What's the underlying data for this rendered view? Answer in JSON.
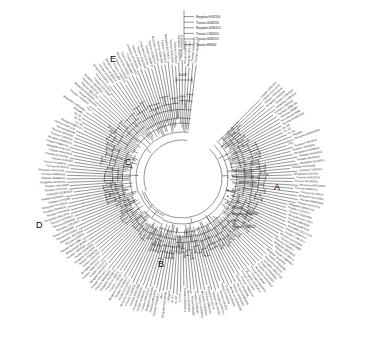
{
  "figure": {
    "type": "circular-phylogenetic-tree",
    "background": "#ffffff",
    "line_color": "#111111",
    "clade_labels": [
      {
        "id": "A",
        "text": "A",
        "x": 274,
        "y": 182
      },
      {
        "id": "B",
        "text": "B",
        "x": 158,
        "y": 259
      },
      {
        "id": "C",
        "text": "C",
        "x": 125,
        "y": 157
      },
      {
        "id": "D",
        "text": "D",
        "x": 36,
        "y": 220
      },
      {
        "id": "E",
        "text": "E",
        "x": 110,
        "y": 54
      }
    ],
    "scale_bar": {
      "label": "0.02",
      "x": 176,
      "y": 72
    },
    "symbols": {
      "filled_circle": "●",
      "open_circle": "○",
      "filled_triangle": "▲",
      "open_triangle": "△",
      "filled_square": "■",
      "open_square": "□"
    },
    "center": {
      "x": 182,
      "y": 178
    },
    "inner_radius": 40,
    "outer_radius": 118,
    "label_radius": 121
  },
  "legend_cluster": {
    "note": "inner text block near clade A listing strains with symbols",
    "items": [
      {
        "symbol": "●",
        "label": "Thiostan-A16/2811"
      },
      {
        "symbol": "●",
        "label": "Norovirus/GII/2009"
      },
      {
        "symbol": "○",
        "label": "Thiostan-DOB5/2010"
      },
      {
        "symbol": "■",
        "label": "ILL-S3"
      },
      {
        "symbol": "■",
        "label": "ILL-S2"
      },
      {
        "symbol": "■",
        "label": "ILL-S1"
      },
      {
        "symbol": "○",
        "label": "HKG/p05"
      },
      {
        "symbol": "△",
        "label": "Mongolian-01R20/2061"
      },
      {
        "symbol": "▼",
        "label": "ITALY"
      },
      {
        "symbol": "○",
        "label": "Thiostan-TH20/2011"
      }
    ]
  },
  "top_inset": {
    "note": "small upper-right sub-clade labels",
    "items": [
      "Mongolian-H16/2009",
      "Thiostan-GDB4/230",
      "Mongolian-GDB/2012",
      "Thiostan-CGB/2010",
      "Thiostan-GDB5/201",
      "Thiostan-HN0082"
    ]
  },
  "tip_labels": {
    "count": 186,
    "sample": [
      "Thiostan-A16/2811",
      "Thiostan-CD20/2011",
      "Thiostan-HN44/2010",
      "Mongolian-H16/2009",
      "Thiostan-GDB4/230",
      "Mongolian-GDB/2012",
      "Thiostan-CGB/2010",
      "Thiostan-GDB5/201",
      "Thiostan-HN0082",
      "Norovirus/GII/2009",
      "Thiostan-DOB5/2010",
      "ILL-S3",
      "ILL-S2",
      "ILL-S1",
      "HKG/p05",
      "Mongolian-01R20/2061",
      "ITALY",
      "Thiostan-TH20/2011",
      "Thiostan-HN52/2011",
      "Mongolian-KD33/2010",
      "Thiostan-HB12/2012",
      "Thiostan-JS44/2010",
      "Mongolian-SD10/2011",
      "Thiostan-GZ07/2009",
      "Thiostan-FJ19/2010",
      "Mongolian-ZJ22/2011",
      "Thiostan-AH31/2012",
      "Thiostan-SX18/2010",
      "Mongolian-HE25/2009",
      "Thiostan-LN39/2011",
      "Thiostan-JL14/2010",
      "Mongolian-HL27/2012",
      "Thiostan-NM08/2009",
      "Thiostan-GS41/2011",
      "Mongolian-QH16/2010",
      "Thiostan-XJ23/2012",
      "Thiostan-YN35/2009",
      "Mongolian-GX12/2011",
      "Thiostan-HI09/2010",
      "Thiostan-CQ28/2012",
      "Mongolian-SC37/2009",
      "Thiostan-GZ44/2011",
      "Thiostan-TJ06/2010",
      "Mongolian-BJ19/2012",
      "Thiostan-SH31/2009",
      "Thiostan-ZJ48/2011",
      "Mongolian-JS27/2010",
      "Thiostan-AH15/2012",
      "Thiostan-FJ33/2009",
      "Mongolian-JX21/2011",
      "Thiostan-SD40/2010",
      "Thiostan-HA29/2012",
      "Mongolian-HB11/2009",
      "Thiostan-HN36/2011",
      "Thiostan-GD24/2010",
      "Mongolian-GX43/2012",
      "Thiostan-HI17/2009",
      "Thiostan-CQ30/2011",
      "Mongolian-SC08/2010",
      "Thiostan-GZ22/2012",
      "Thiostan-YN46/2009",
      "Mongolian-XZ13/2011",
      "Thiostan-SN38/2010",
      "Thiostan-GS25/2012",
      "Mongolian-QH41/2009",
      "Thiostan-NX18/2011",
      "Thiostan-XJ32/2010"
    ]
  }
}
